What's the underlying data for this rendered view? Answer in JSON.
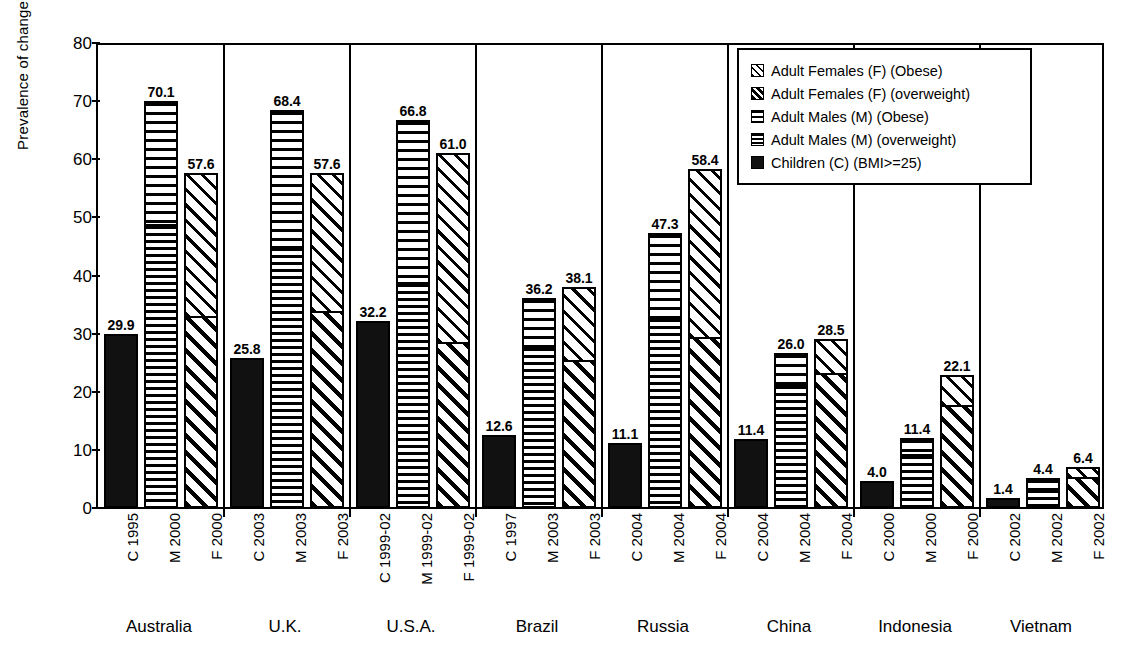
{
  "chart_data": {
    "type": "bar",
    "title": "",
    "xlabel": "",
    "ylabel": "Prevalence of change",
    "ylim": [
      0,
      80
    ],
    "ytick_values": [
      0,
      10,
      20,
      30,
      40,
      50,
      60,
      70,
      80
    ],
    "ytick_labels": [
      "0",
      "10",
      "20",
      "30",
      "40",
      "50",
      "60",
      "70",
      "80"
    ],
    "grid": false,
    "legend_position": "top-right",
    "legend": [
      {
        "label": "Adult Females (F) (Obese)",
        "pattern": "diagonal-sparse"
      },
      {
        "label": "Adult Females (F) (overweight)",
        "pattern": "diagonal-dense"
      },
      {
        "label": "Adult Males (M) (Obese)",
        "pattern": "horizontal-sparse"
      },
      {
        "label": "Adult Males (M) (overweight)",
        "pattern": "horizontal-dense"
      },
      {
        "label": "Children (C) (BMI>=25)",
        "pattern": "solid-black"
      }
    ],
    "groups": [
      {
        "name": "Australia",
        "bars": [
          {
            "tick": "C 1995",
            "label": "29.9",
            "value": 29.9,
            "kind": "children",
            "segments": [
              {
                "series": "Children (C) (BMI>=25)",
                "value": 29.9
              }
            ]
          },
          {
            "tick": "M 2000",
            "label": "70.1",
            "value": 70.1,
            "kind": "male",
            "segments": [
              {
                "series": "Adult Males (M) (overweight)",
                "value": 49.0
              },
              {
                "series": "Adult Males (M) (Obese)",
                "value": 21.1
              }
            ]
          },
          {
            "tick": "F 2000",
            "label": "57.6",
            "value": 57.6,
            "kind": "female",
            "segments": [
              {
                "series": "Adult Females (F) (overweight)",
                "value": 33.0
              },
              {
                "series": "Adult Females (F) (Obese)",
                "value": 24.6
              }
            ]
          }
        ]
      },
      {
        "name": "U.K.",
        "bars": [
          {
            "tick": "C 2003",
            "label": "25.8",
            "value": 25.8,
            "kind": "children",
            "segments": [
              {
                "series": "Children (C) (BMI>=25)",
                "value": 25.8
              }
            ]
          },
          {
            "tick": "M 2003",
            "label": "68.4",
            "value": 68.4,
            "kind": "male",
            "segments": [
              {
                "series": "Adult Males (M) (overweight)",
                "value": 45.2
              },
              {
                "series": "Adult Males (M) (Obese)",
                "value": 23.2
              }
            ]
          },
          {
            "tick": "F 2003",
            "label": "57.6",
            "value": 57.6,
            "kind": "female",
            "segments": [
              {
                "series": "Adult Females (F) (overweight)",
                "value": 34.0
              },
              {
                "series": "Adult Females (F) (Obese)",
                "value": 23.6
              }
            ]
          }
        ]
      },
      {
        "name": "U.S.A.",
        "bars": [
          {
            "tick": "C 1999-02",
            "label": "32.2",
            "value": 32.2,
            "kind": "children",
            "segments": [
              {
                "series": "Children (C) (BMI>=25)",
                "value": 32.2
              }
            ]
          },
          {
            "tick": "M 1999-02",
            "label": "66.8",
            "value": 66.8,
            "kind": "male",
            "segments": [
              {
                "series": "Adult Males (M) (overweight)",
                "value": 39.0
              },
              {
                "series": "Adult Males (M) (Obese)",
                "value": 27.8
              }
            ]
          },
          {
            "tick": "F 1999-02",
            "label": "61.0",
            "value": 61.0,
            "kind": "female",
            "segments": [
              {
                "series": "Adult Females (F) (overweight)",
                "value": 28.5
              },
              {
                "series": "Adult Females (F) (Obese)",
                "value": 32.5
              }
            ]
          }
        ]
      },
      {
        "name": "Brazil",
        "bars": [
          {
            "tick": "C 1997",
            "label": "12.6",
            "value": 12.6,
            "kind": "children",
            "segments": [
              {
                "series": "Children (C) (BMI>=25)",
                "value": 12.6
              }
            ]
          },
          {
            "tick": "M 2003",
            "label": "36.2",
            "value": 36.2,
            "kind": "male",
            "segments": [
              {
                "series": "Adult Males (M) (overweight)",
                "value": 28.0
              },
              {
                "series": "Adult Males (M) (Obese)",
                "value": 8.2
              }
            ]
          },
          {
            "tick": "F 2003",
            "label": "38.1",
            "value": 38.1,
            "kind": "female",
            "segments": [
              {
                "series": "Adult Females (F) (overweight)",
                "value": 25.5
              },
              {
                "series": "Adult Females (F) (Obese)",
                "value": 12.6
              }
            ]
          }
        ]
      },
      {
        "name": "Russia",
        "bars": [
          {
            "tick": "C 2004",
            "label": "11.1",
            "value": 11.1,
            "kind": "children",
            "segments": [
              {
                "series": "Children (C) (BMI>=25)",
                "value": 11.1
              }
            ]
          },
          {
            "tick": "M 2004",
            "label": "47.3",
            "value": 47.3,
            "kind": "male",
            "segments": [
              {
                "series": "Adult Males (M) (overweight)",
                "value": 33.0
              },
              {
                "series": "Adult Males (M) (Obese)",
                "value": 14.3
              }
            ]
          },
          {
            "tick": "F 2004",
            "label": "58.4",
            "value": 58.4,
            "kind": "female",
            "segments": [
              {
                "series": "Adult Females (F) (overweight)",
                "value": 29.5
              },
              {
                "series": "Adult Females (F) (Obese)",
                "value": 28.9
              }
            ]
          }
        ]
      },
      {
        "name": "China",
        "bars": [
          {
            "tick": "C 2004",
            "label": "11.4",
            "value": 11.4,
            "kind": "children",
            "segments": [
              {
                "series": "Children (C) (BMI>=25)",
                "value": 11.9
              }
            ]
          },
          {
            "tick": "M 2004",
            "label": "26.0",
            "value": 26.0,
            "kind": "male",
            "segments": [
              {
                "series": "Adult Males (M) (overweight)",
                "value": 21.5
              },
              {
                "series": "Adult Males (M) (Obese)",
                "value": 5.2
              }
            ]
          },
          {
            "tick": "F 2004",
            "label": "28.5",
            "value": 28.5,
            "kind": "female",
            "segments": [
              {
                "series": "Adult Females (F) (overweight)",
                "value": 23.5
              },
              {
                "series": "Adult Females (F) (Obese)",
                "value": 5.5
              }
            ]
          }
        ]
      },
      {
        "name": "Indonesia",
        "bars": [
          {
            "tick": "C 2000",
            "label": "4.0",
            "value": 4.0,
            "kind": "children",
            "segments": [
              {
                "series": "Children (C) (BMI>=25)",
                "value": 4.6
              }
            ]
          },
          {
            "tick": "M 2000",
            "label": "11.4",
            "value": 11.4,
            "kind": "male",
            "segments": [
              {
                "series": "Adult Males (M) (overweight)",
                "value": 9.5
              },
              {
                "series": "Adult Males (M) (Obese)",
                "value": 2.5
              }
            ]
          },
          {
            "tick": "F 2000",
            "label": "22.1",
            "value": 22.1,
            "kind": "female",
            "segments": [
              {
                "series": "Adult Females (F) (overweight)",
                "value": 18.0
              },
              {
                "series": "Adult Females (F) (Obese)",
                "value": 4.8
              }
            ]
          }
        ]
      },
      {
        "name": "Vietnam",
        "bars": [
          {
            "tick": "C 2002",
            "label": "1.4",
            "value": 1.4,
            "kind": "children",
            "segments": [
              {
                "series": "Children (C) (BMI>=25)",
                "value": 1.8
              }
            ]
          },
          {
            "tick": "M 2002",
            "label": "4.4",
            "value": 4.4,
            "kind": "male",
            "segments": [
              {
                "series": "Adult Males (M) (overweight)",
                "value": 3.6
              },
              {
                "series": "Adult Males (M) (Obese)",
                "value": 1.5
              }
            ]
          },
          {
            "tick": "F 2002",
            "label": "6.4",
            "value": 6.4,
            "kind": "female",
            "segments": [
              {
                "series": "Adult Females (F) (overweight)",
                "value": 5.5
              },
              {
                "series": "Adult Females (F) (Obese)",
                "value": 1.5
              }
            ]
          }
        ]
      }
    ]
  }
}
